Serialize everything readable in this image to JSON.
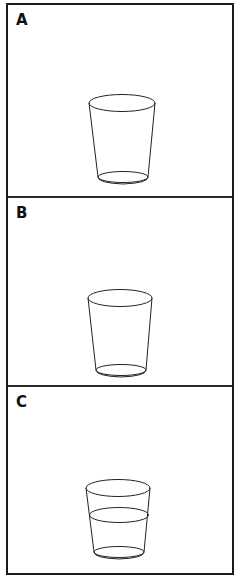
{
  "figure": {
    "panels": [
      {
        "label": "A",
        "cup": "empty tumbler glass",
        "water": false
      },
      {
        "label": "B",
        "cup": "empty tumbler glass",
        "water": false
      },
      {
        "label": "C",
        "cup": "tumbler glass partially filled with water",
        "water": true
      }
    ],
    "colors": {
      "line": "#222222",
      "border": "#1a1a1a",
      "background": "#ffffff"
    }
  }
}
